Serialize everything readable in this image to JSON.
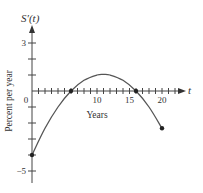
{
  "chart_data": {
    "type": "line",
    "title": "",
    "ylabel_top": "S′(t)",
    "ylabel": "Percent per year",
    "xlabel": "Years",
    "xaxis_var": "t",
    "xlim": [
      0,
      23
    ],
    "ylim": [
      -5.7,
      4.5
    ],
    "x_tick_labels": [
      {
        "value": 0,
        "label": "0"
      },
      {
        "value": 10,
        "label": "10"
      },
      {
        "value": 15,
        "label": "15"
      },
      {
        "value": 20,
        "label": "20"
      }
    ],
    "x_minor_ticks_step": 1,
    "y_tick_labels": [
      {
        "value": 3,
        "label": "3"
      },
      {
        "value": -5,
        "label": "−5"
      }
    ],
    "y_minor_ticks_step": 1,
    "grid": false,
    "legend": null,
    "series": [
      {
        "name": "S′(t)",
        "x": [
          0,
          2,
          4,
          6,
          8,
          10,
          11,
          12,
          14,
          16,
          18,
          20
        ],
        "values": [
          -4.0,
          -2.33,
          -1.0,
          0.0,
          0.67,
          1.0,
          1.04,
          1.0,
          0.67,
          0.0,
          -1.0,
          -2.33
        ]
      }
    ],
    "marked_points": [
      {
        "x": 0,
        "y": -4.0
      },
      {
        "x": 6,
        "y": 0
      },
      {
        "x": 16,
        "y": 0
      },
      {
        "x": 20,
        "y": -2.33
      }
    ],
    "colors": {
      "axis": "#444444",
      "curve": "#555555",
      "text": "#333333"
    }
  }
}
